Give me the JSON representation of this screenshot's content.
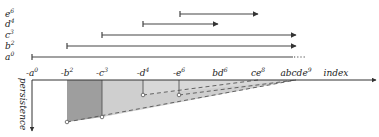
{
  "bars": [
    {
      "label": "e",
      "sup": "6",
      "y": 14,
      "x1": 180,
      "x2": 258,
      "end": "arrow"
    },
    {
      "label": "d",
      "sup": "4",
      "y": 24,
      "x1": 143,
      "x2": 218,
      "end": "arrow"
    },
    {
      "label": "c",
      "sup": "3",
      "y": 35,
      "x1": 102,
      "x2": 296,
      "end": "arrow"
    },
    {
      "label": "b",
      "sup": "2",
      "y": 46,
      "x1": 67,
      "x2": 296,
      "end": "arrow"
    },
    {
      "label": "a",
      "sup": "0",
      "y": 57,
      "x1": 32,
      "x2": 296,
      "end": "dots"
    }
  ],
  "axis": {
    "x_label": "index",
    "y_label": "persistence",
    "ticks": [
      {
        "text": "-a",
        "sup": "0",
        "x": 32
      },
      {
        "text": "-b",
        "sup": "2",
        "x": 67
      },
      {
        "text": "-c",
        "sup": "3",
        "x": 102
      },
      {
        "text": "-d",
        "sup": "4",
        "x": 143
      },
      {
        "text": "-e",
        "sup": "6",
        "x": 179
      },
      {
        "text": "bd",
        "sup": "6",
        "x": 220
      },
      {
        "text": "ce",
        "sup": "8",
        "x": 258
      },
      {
        "text": "abcde",
        "sup": "9",
        "x": 296
      }
    ]
  },
  "colors": {
    "dark_region": "#9a9a9a",
    "mid_region": "#c8c8c8",
    "light_region": "#e4e4e4",
    "line": "#333333"
  }
}
